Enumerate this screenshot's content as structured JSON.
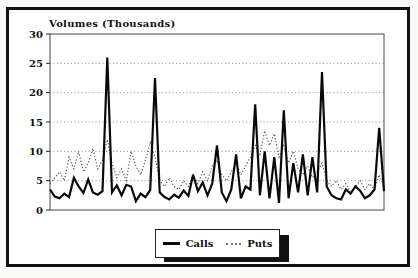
{
  "title": "Volumes (Thousands)",
  "colors": {
    "frame_border": "#111111",
    "background": "#ffffff",
    "calls_line": "#0a0a0a",
    "puts_line": "#4a4a4a",
    "gridline": "#8a8a8a",
    "axis": "#444444"
  },
  "legend": {
    "calls_label": "Calls",
    "puts_label": "Puts"
  },
  "chart_data": {
    "type": "line",
    "title": "Volumes (Thousands)",
    "xlabel": "",
    "ylabel": "",
    "ylim": [
      0,
      30
    ],
    "yticks": [
      0,
      5,
      10,
      15,
      20,
      25,
      30
    ],
    "grid": "horizontal dotted gridlines at 5,10,15,20,25",
    "x_axis_labels": "none shown",
    "legend_position": "bottom-center boxed with drop shadow",
    "series": [
      {
        "name": "Calls",
        "style": "solid",
        "color": "#0a0a0a",
        "values": [
          3.5,
          2.3,
          2.0,
          2.8,
          2.2,
          5.5,
          4.0,
          2.9,
          5.2,
          3.0,
          2.6,
          3.2,
          26.0,
          3.0,
          4.2,
          2.5,
          4.3,
          4.0,
          1.5,
          2.8,
          2.2,
          3.4,
          22.5,
          3.0,
          2.2,
          1.8,
          2.6,
          2.1,
          3.3,
          2.4,
          6.0,
          3.2,
          4.7,
          2.5,
          4.5,
          11.0,
          3.0,
          1.5,
          3.5,
          9.5,
          2.0,
          4.0,
          3.5,
          18.0,
          2.5,
          10.0,
          2.0,
          9.0,
          1.2,
          17.0,
          2.0,
          8.0,
          3.0,
          9.5,
          2.5,
          9.0,
          3.0,
          23.5,
          4.0,
          2.5,
          2.0,
          1.8,
          3.5,
          2.8,
          4.0,
          3.3,
          2.0,
          2.5,
          3.5,
          14.0,
          3.2
        ]
      },
      {
        "name": "Puts",
        "style": "dotted",
        "color": "#4a4a4a",
        "values": [
          4.5,
          5.5,
          6.5,
          5.0,
          9.0,
          7.0,
          10.0,
          6.5,
          8.0,
          10.5,
          7.0,
          8.5,
          12.0,
          8.0,
          5.5,
          7.0,
          5.0,
          10.0,
          7.5,
          6.0,
          8.5,
          11.5,
          9.0,
          5.0,
          4.0,
          5.5,
          4.0,
          3.5,
          5.0,
          4.0,
          6.0,
          4.5,
          6.5,
          5.0,
          7.5,
          8.5,
          6.0,
          5.0,
          6.5,
          8.0,
          6.0,
          7.5,
          9.0,
          11.0,
          9.5,
          13.5,
          11.0,
          13.0,
          9.0,
          11.0,
          8.0,
          10.0,
          7.0,
          6.0,
          7.5,
          5.5,
          6.5,
          8.0,
          5.0,
          4.0,
          5.0,
          3.5,
          4.5,
          3.0,
          4.0,
          5.0,
          3.5,
          4.5,
          3.5,
          6.0,
          4.0
        ]
      }
    ]
  }
}
